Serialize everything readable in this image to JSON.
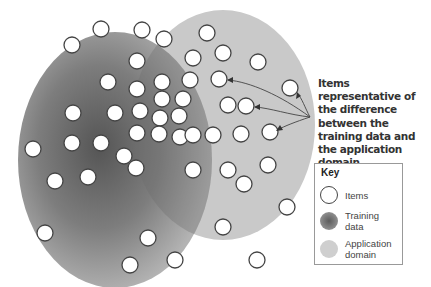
{
  "diagram": {
    "callout_text": "Items representative of the difference between the training data and the application domain",
    "colors": {
      "training_center": "#5a5a5a",
      "training_edge": "#a9a9a9",
      "application_domain": "#c8c8c8",
      "overlap": "#8e8e8e",
      "item_fill": "#ffffff",
      "item_stroke": "#444444"
    },
    "items": [
      [
        72,
        45
      ],
      [
        101,
        29
      ],
      [
        142,
        30
      ],
      [
        164,
        39
      ],
      [
        207,
        33
      ],
      [
        223,
        53
      ],
      [
        258,
        62
      ],
      [
        193,
        58
      ],
      [
        108,
        82
      ],
      [
        137,
        61
      ],
      [
        137,
        89
      ],
      [
        162,
        82
      ],
      [
        190,
        80
      ],
      [
        219,
        79
      ],
      [
        290,
        88
      ],
      [
        73,
        113
      ],
      [
        115,
        113
      ],
      [
        140,
        111
      ],
      [
        162,
        99
      ],
      [
        183,
        99
      ],
      [
        160,
        118
      ],
      [
        179,
        116
      ],
      [
        228,
        105
      ],
      [
        246,
        106
      ],
      [
        33,
        149
      ],
      [
        72,
        143
      ],
      [
        101,
        143
      ],
      [
        124,
        156
      ],
      [
        137,
        133
      ],
      [
        159,
        134
      ],
      [
        180,
        137
      ],
      [
        193,
        135
      ],
      [
        213,
        135
      ],
      [
        241,
        134
      ],
      [
        270,
        132
      ],
      [
        55,
        181
      ],
      [
        88,
        177
      ],
      [
        136,
        168
      ],
      [
        193,
        170
      ],
      [
        228,
        170
      ],
      [
        244,
        184
      ],
      [
        268,
        165
      ],
      [
        287,
        207
      ],
      [
        45,
        233
      ],
      [
        148,
        238
      ],
      [
        223,
        227
      ],
      [
        175,
        260
      ],
      [
        130,
        265
      ],
      [
        257,
        260
      ]
    ],
    "highlighted_items": [
      [
        219,
        79
      ],
      [
        246,
        106
      ],
      [
        270,
        132
      ],
      [
        290,
        88
      ]
    ]
  },
  "key": {
    "title": "Key",
    "entries": [
      {
        "label": "Items",
        "swatch": "items"
      },
      {
        "label": "Training data",
        "swatch": "training"
      },
      {
        "label": "Application domain",
        "swatch": "application"
      }
    ]
  }
}
